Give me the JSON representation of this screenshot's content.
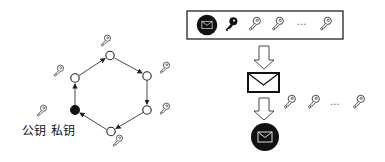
{
  "ring": {
    "public_key_label": "公钥",
    "private_key_label": "私钥",
    "nodes": [
      {
        "id": "top",
        "x": 110,
        "y": 56,
        "filled": false
      },
      {
        "id": "upper-right",
        "x": 147,
        "y": 76,
        "filled": false
      },
      {
        "id": "lower-right",
        "x": 147,
        "y": 110,
        "filled": false
      },
      {
        "id": "bottom",
        "x": 111,
        "y": 131,
        "filled": false
      },
      {
        "id": "lower-left",
        "x": 75,
        "y": 110,
        "filled": true
      },
      {
        "id": "upper-left",
        "x": 75,
        "y": 78,
        "filled": false
      }
    ]
  },
  "signature_box": {
    "ellipsis": "..."
  },
  "verify_keys": {
    "ellipsis": "..."
  },
  "colors": {
    "stroke": "#222222",
    "fill_dark": "#111111",
    "background": "#ffffff"
  }
}
